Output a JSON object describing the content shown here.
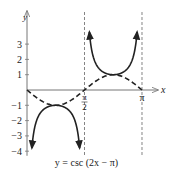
{
  "chart_data": {
    "type": "line",
    "title": "y = csc (2x − π)",
    "xlabel": "x",
    "ylabel": "y",
    "xlim": [
      0,
      3.3
    ],
    "ylim": [
      -4.3,
      4
    ],
    "grid": false,
    "x_ticks": [
      {
        "value": 1.5708,
        "label_num": "π",
        "label_den": "2"
      },
      {
        "value": 3.14159,
        "label": "π"
      }
    ],
    "y_ticks": [
      {
        "value": 3,
        "label": "3"
      },
      {
        "value": 2,
        "label": "2"
      },
      {
        "value": 1,
        "label": "1"
      },
      {
        "value": -1,
        "label": "−1"
      },
      {
        "value": -2,
        "label": "−2"
      },
      {
        "value": -3,
        "label": "−3"
      },
      {
        "value": -4,
        "label": "−4"
      }
    ],
    "asymptotes": [
      1.5708,
      3.14159
    ],
    "series": [
      {
        "name": "y = csc (2x − π)",
        "style": "solid",
        "function": "csc(2x - pi)",
        "branches": [
          {
            "domain": [
              0,
              1.5708
            ],
            "extremum": {
              "x": 0.7854,
              "y": -1
            }
          },
          {
            "domain": [
              1.5708,
              3.14159
            ],
            "extremum": {
              "x": 2.3562,
              "y": 1
            }
          }
        ]
      },
      {
        "name": "y = sin (2x − π)",
        "style": "dashed",
        "function": "sin(2x - pi)",
        "domain": [
          0,
          3.14159
        ],
        "points": [
          [
            0,
            0
          ],
          [
            0.7854,
            -1
          ],
          [
            1.5708,
            0
          ],
          [
            2.3562,
            1
          ],
          [
            3.14159,
            0
          ]
        ]
      }
    ]
  },
  "caption": "y = csc (2x − π)",
  "axis_labels": {
    "x": "x",
    "y": "y"
  }
}
